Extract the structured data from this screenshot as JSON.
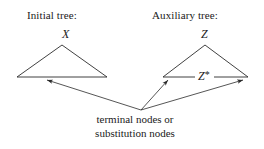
{
  "figure": {
    "type": "diagram",
    "background_color": "#ffffff",
    "line_color": "#2b2b2b",
    "text_color": "#1a1a1a",
    "labels": {
      "initial_tree_heading": "Initial tree:",
      "auxiliary_tree_heading": "Auxiliary tree:",
      "initial_root_node": "X",
      "auxiliary_root_node": "Z",
      "foot_node": "Z",
      "foot_node_star": "*",
      "caption_line1": "terminal nodes or",
      "caption_line2": "substitution nodes"
    },
    "shapes": {
      "initial_triangle": {
        "apex_x": 62,
        "apex_y": 45,
        "left_x": 17,
        "right_x": 107,
        "base_y": 77
      },
      "auxiliary_triangle": {
        "apex_x": 205,
        "apex_y": 45,
        "left_x": 163,
        "right_x": 248,
        "base_y": 77
      }
    },
    "arrows": {
      "origin_x": 141,
      "origin_y": 110,
      "targets": [
        {
          "name": "arrow-to-initial-frontier",
          "x": 47,
          "y": 80
        },
        {
          "name": "arrow-to-auxiliary-left-frontier",
          "x": 168,
          "y": 80
        },
        {
          "name": "arrow-to-auxiliary-right-frontier",
          "x": 243,
          "y": 80
        }
      ]
    }
  }
}
